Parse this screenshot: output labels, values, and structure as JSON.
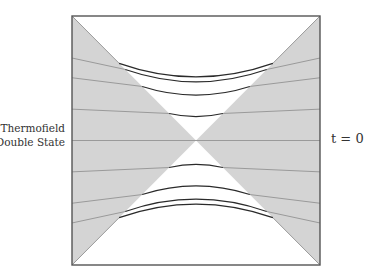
{
  "labels": {
    "state_line1": "Thermofield",
    "state_line2": "Double State",
    "time_slice": "t = 0"
  },
  "colors": {
    "frame": "#555555",
    "wedge_fill": "#d4d4d4",
    "slice_in_wedge": "#9a9a9a",
    "slice_in_interior": "#2a2a2a",
    "background": "#ffffff"
  },
  "diagram": {
    "type": "penrose-diagram",
    "regions": [
      "left-exterior",
      "right-exterior",
      "future-interior",
      "past-interior"
    ],
    "time_slices": [
      {
        "name": "slice-top-1",
        "t": 4,
        "wedge_y": -1.0,
        "sag": 0.22
      },
      {
        "name": "slice-top-2",
        "t": 3,
        "wedge_y": -0.92,
        "sag": 0.2
      },
      {
        "name": "slice-top-3",
        "t": 2,
        "wedge_y": -0.7,
        "sag": 0.14
      },
      {
        "name": "slice-top-4",
        "t": 1,
        "wedge_y": -0.35,
        "sag": 0.05
      },
      {
        "name": "slice-t0",
        "t": 0,
        "wedge_y": 0.0,
        "sag": 0.0
      },
      {
        "name": "slice-bottom-4",
        "t": -1,
        "wedge_y": 0.35,
        "sag": -0.05
      },
      {
        "name": "slice-bottom-3",
        "t": -2,
        "wedge_y": 0.7,
        "sag": -0.14
      },
      {
        "name": "slice-bottom-2",
        "t": -3,
        "wedge_y": 0.92,
        "sag": -0.2
      },
      {
        "name": "slice-bottom-1",
        "t": -4,
        "wedge_y": 1.0,
        "sag": -0.22
      }
    ]
  }
}
